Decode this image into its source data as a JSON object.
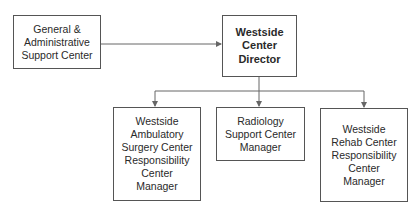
{
  "diagram": {
    "type": "org-chart",
    "colors": {
      "line": "#666666",
      "border": "#555555",
      "text": "#2a2a2a",
      "background": "#ffffff"
    },
    "nodes": {
      "ga": {
        "id": "ga",
        "lines": [
          "General &",
          "Administrative",
          "Support Center"
        ]
      },
      "director": {
        "id": "director",
        "lines": [
          "Westside",
          "Center",
          "Director"
        ]
      },
      "surgery": {
        "id": "surgery",
        "lines": [
          "Westside",
          "Ambulatory",
          "Surgery Center",
          "Responsibility",
          "Center",
          "Manager"
        ]
      },
      "radiology": {
        "id": "radiology",
        "lines": [
          "Radiology",
          "Support Center",
          "Manager"
        ]
      },
      "rehab": {
        "id": "rehab",
        "lines": [
          "Westside",
          "Rehab Center",
          "Responsibility",
          "Center",
          "Manager"
        ]
      }
    },
    "edges": [
      {
        "from": "ga",
        "to": "director"
      },
      {
        "from": "director",
        "to": "surgery"
      },
      {
        "from": "director",
        "to": "radiology"
      },
      {
        "from": "director",
        "to": "rehab"
      }
    ]
  }
}
